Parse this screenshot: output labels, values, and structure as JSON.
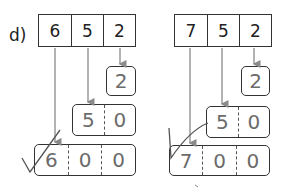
{
  "label": "d)",
  "problems": [
    {
      "digits": [
        "6",
        "5",
        "2"
      ],
      "units_box": [
        "2"
      ],
      "tens_box": [
        "5",
        "0"
      ],
      "hundreds_box": [
        "6",
        "0",
        "0"
      ]
    },
    {
      "digits": [
        "7",
        "5",
        "2"
      ],
      "units_box": [
        "2"
      ],
      "tens_box": [
        "5",
        "0"
      ],
      "hundreds_box": [
        "7",
        "0",
        "0"
      ]
    }
  ],
  "colors": {
    "line": "#8a8a8a",
    "border": "#333333",
    "handwriting": "#6b6b6b",
    "check": "#555555"
  }
}
